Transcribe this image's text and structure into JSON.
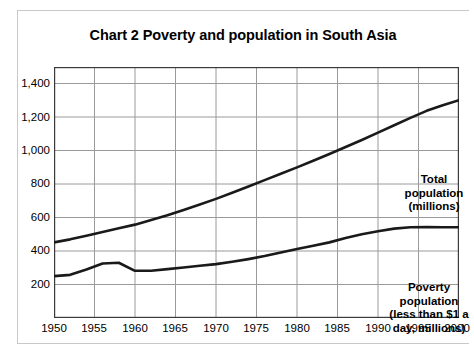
{
  "chart_data": {
    "type": "line",
    "title": "Chart 2 Poverty and population in South Asia",
    "xlabel": "",
    "ylabel": "",
    "xlim": [
      1950,
      2000
    ],
    "ylim": [
      0,
      1500
    ],
    "grid": true,
    "legend_position": "inline-annotations",
    "x_ticks": [
      "1950",
      "1955",
      "1960",
      "1965",
      "1970",
      "1975",
      "1980",
      "1985",
      "1990",
      "1995",
      "2000"
    ],
    "y_ticks": [
      "200",
      "400",
      "600",
      "800",
      "1,000",
      "1,200",
      "1,400"
    ],
    "x": [
      1950,
      1952,
      1954,
      1956,
      1958,
      1960,
      1962,
      1964,
      1966,
      1968,
      1970,
      1972,
      1974,
      1976,
      1978,
      1980,
      1982,
      1984,
      1986,
      1988,
      1990,
      1992,
      1994,
      1996,
      1998,
      2000
    ],
    "series": [
      {
        "name": "Total population (millions)",
        "color": "#1a1a1a",
        "values": [
          452,
          470,
          492,
          514,
          536,
          558,
          586,
          614,
          646,
          678,
          712,
          748,
          786,
          824,
          862,
          900,
          940,
          980,
          1022,
          1064,
          1108,
          1152,
          1196,
          1238,
          1272,
          1302
        ]
      },
      {
        "name": "Poverty population (less than $1 a day, millions)",
        "color": "#1a1a1a",
        "values": [
          250,
          258,
          290,
          326,
          330,
          282,
          282,
          292,
          302,
          312,
          322,
          336,
          352,
          370,
          392,
          412,
          432,
          452,
          478,
          500,
          518,
          534,
          542,
          544,
          542,
          542
        ]
      }
    ],
    "annotations": [
      {
        "id": "total-population",
        "text": "Total\npopulation\n(millions)"
      },
      {
        "id": "poverty-population",
        "text": "Poverty\npopulation\n(less than $1 a\nday, millions)"
      }
    ]
  }
}
